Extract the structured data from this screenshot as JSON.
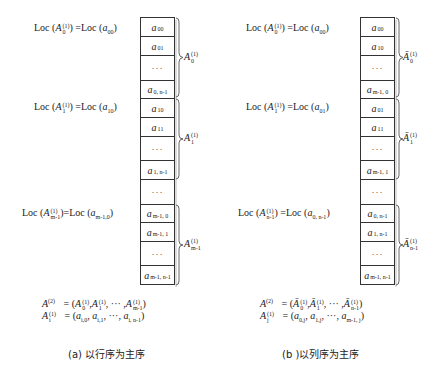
{
  "panel_a": {
    "loc_labels": [
      {
        "text": "Loc (A(1)0) =Loc (a00)",
        "lhs_sub": "0",
        "rhs_sub": "00"
      },
      {
        "text": "Loc (A(1)1) =Loc (a10)",
        "lhs_sub": "1",
        "rhs_sub": "10"
      },
      {
        "text": "Loc (A(1)m-1)=Loc (am-1,0)",
        "lhs_sub": "m-1",
        "rhs_sub": "m-1,0"
      }
    ],
    "cells": [
      {
        "var": "a",
        "sub": "00"
      },
      {
        "var": "a",
        "sub": "01"
      },
      {
        "var": "",
        "sub": "",
        "dots": "···"
      },
      {
        "var": "a",
        "sub": "0, n-1"
      },
      {
        "var": "a",
        "sub": "10"
      },
      {
        "var": "a",
        "sub": "11"
      },
      {
        "var": "",
        "sub": "",
        "dots": "···"
      },
      {
        "var": "a",
        "sub": "1, n-1"
      },
      {
        "var": "",
        "sub": "",
        "dots": "···"
      },
      {
        "var": "a",
        "sub": "m-1, 0"
      },
      {
        "var": "a",
        "sub": "m-1, 1"
      },
      {
        "var": "",
        "sub": "",
        "dots": "···"
      },
      {
        "var": "a",
        "sub": "m-1, n-1"
      }
    ],
    "brace_labels": [
      {
        "base": "A",
        "sup": "(1)",
        "sub": "0"
      },
      {
        "base": "A",
        "sup": "(1)",
        "sub": "1"
      },
      {
        "base": "A",
        "sup": "(1)",
        "sub": "m-1"
      }
    ],
    "formula_line1": {
      "lhs": "A",
      "lhs_sup": "(2)",
      "rhs": "= (A(1)0 ,A(1)1 , ··· ,A(1)m-1)",
      "subs": [
        "0",
        "1",
        "m-1"
      ],
      "sup": "(1)"
    },
    "formula_line2": {
      "lhs": "A",
      "lhs_sup": "(1)",
      "lhs_sub": "i",
      "items": [
        "i,0",
        "i,1",
        "i, n-1"
      ],
      "sep": "···"
    },
    "caption": "(a) 以行序为主序"
  },
  "panel_b": {
    "loc_labels": [
      {
        "text": "Loc (A(1)0) =Loc (a00)",
        "lhs_sub": "0",
        "rhs_sub": "00"
      },
      {
        "text": "Loc (A(1)1) =Loc (a01)",
        "lhs_sub": "1",
        "rhs_sub": "01"
      },
      {
        "text": "Loc (A(1)n-1) =Loc (a0, n-1)",
        "lhs_sub": "n-1",
        "rhs_sub": "0, n-1"
      }
    ],
    "cells": [
      {
        "var": "a",
        "sub": "00"
      },
      {
        "var": "a",
        "sub": "10"
      },
      {
        "var": "",
        "sub": "",
        "dots": "···"
      },
      {
        "var": "a",
        "sub": "m-1, 0"
      },
      {
        "var": "a",
        "sub": "01"
      },
      {
        "var": "a",
        "sub": "11"
      },
      {
        "var": "",
        "sub": "",
        "dots": "···"
      },
      {
        "var": "a",
        "sub": "m-1, 1"
      },
      {
        "var": "",
        "sub": "",
        "dots": "···"
      },
      {
        "var": "a",
        "sub": "0, n-1"
      },
      {
        "var": "a",
        "sub": "1, n-1"
      },
      {
        "var": "",
        "sub": "",
        "dots": "···"
      },
      {
        "var": "a",
        "sub": "m-1, n-1"
      }
    ],
    "brace_labels": [
      {
        "base": "Ā",
        "sup": "(1)",
        "sub": "0"
      },
      {
        "base": "Ā",
        "sup": "(1)",
        "sub": "1"
      },
      {
        "base": "Ā",
        "sup": "(1)",
        "sub": "n-1"
      }
    ],
    "formula_line1": {
      "lhs": "A",
      "lhs_sup": "(2)",
      "rhs": "= (Ā(1)0 ,Ā(1)1 , ··· ,Ā(1)n-1)",
      "subs": [
        "0",
        "1",
        "n-1"
      ],
      "sup": "(1)"
    },
    "formula_line2": {
      "lhs": "A",
      "lhs_sup": "(1)",
      "lhs_sub": "j",
      "items": [
        "0,j",
        "1,j",
        "m-1, j"
      ],
      "sep": "···"
    },
    "caption": "(b )以列序为主序"
  },
  "symbols": {
    "loc": "Loc",
    "eq": "=Loc",
    "eq_sp": " =Loc",
    "lparen": " (",
    "rparen": ")",
    "A": "A",
    "Abar": "Ā",
    "a": "a",
    "sup1": "(1)",
    "sup2": "(2)",
    "eqparen": "= (",
    "comma": ",",
    "comma_sp": ", ",
    "dots": "···",
    "close": ")"
  }
}
